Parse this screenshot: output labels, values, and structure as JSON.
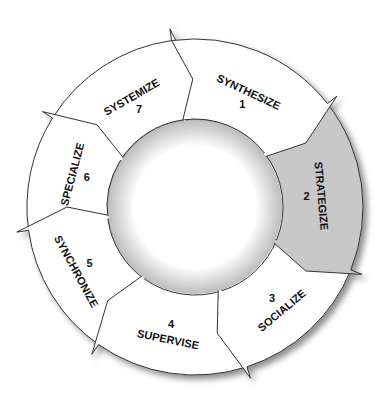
{
  "diagram": {
    "type": "cycle",
    "direction": "clockwise",
    "center": [
      195,
      207
    ],
    "outer_radius": 168,
    "inner_radius": 88,
    "colors": {
      "default_fill": "#ffffff",
      "highlight_fill": "#c8c8c8",
      "stroke": "#333333",
      "center_fill": "#ffffff",
      "shadow": "#9a9a9a"
    },
    "steps": [
      {
        "number": "1",
        "label": "SYNTHESIZE",
        "start": -8,
        "end": 52,
        "highlight": false
      },
      {
        "number": "2",
        "label": "STRATEGIZE",
        "start": 52,
        "end": 112,
        "highlight": true
      },
      {
        "number": "3",
        "label": "SOCIALIZE",
        "start": 112,
        "end": 162,
        "highlight": false
      },
      {
        "number": "4",
        "label": "SUPERVISE",
        "start": 162,
        "end": 215,
        "highlight": false
      },
      {
        "number": "5",
        "label": "SYNCHRONIZE",
        "start": 215,
        "end": 262,
        "highlight": false
      },
      {
        "number": "6",
        "label": "SPECIALIZE",
        "start": 262,
        "end": 302,
        "highlight": false
      },
      {
        "number": "7",
        "label": "SYSTEMIZE",
        "start": 302,
        "end": 352,
        "highlight": false
      }
    ]
  }
}
